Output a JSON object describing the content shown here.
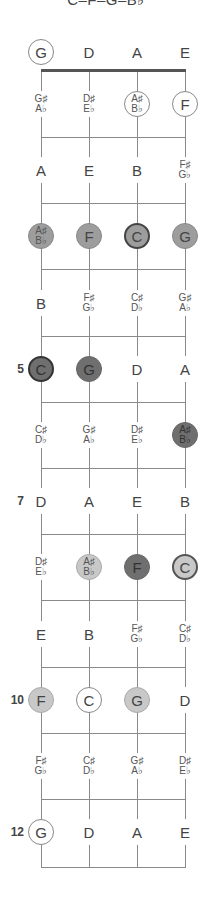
{
  "title": "C–F–G–B♭",
  "strings": [
    "G",
    "D",
    "A",
    "E"
  ],
  "fret_markers": [
    {
      "fret": 5,
      "label": "5"
    },
    {
      "fret": 7,
      "label": "7"
    },
    {
      "fret": 10,
      "label": "10"
    },
    {
      "fret": 12,
      "label": "12"
    }
  ],
  "legend_styles": {
    "plain": "not in chord",
    "outline": "chord tone (open/outlined)",
    "light": "light gray fill",
    "mid": "medium gray fill",
    "dark": "dark gray fill",
    "ring": "root emphasis"
  },
  "rows": [
    {
      "fret": 0,
      "notes": [
        {
          "label": "G",
          "style": "outline"
        },
        {
          "label": "D",
          "style": "plain"
        },
        {
          "label": "A",
          "style": "plain"
        },
        {
          "label": "E",
          "style": "plain"
        }
      ]
    },
    {
      "fret": 1,
      "notes": [
        {
          "label": "G♯|A♭",
          "style": "plain"
        },
        {
          "label": "D♯|E♭",
          "style": "plain"
        },
        {
          "label": "A♯|B♭",
          "style": "outline"
        },
        {
          "label": "F",
          "style": "outline"
        }
      ]
    },
    {
      "fret": 2,
      "notes": [
        {
          "label": "A",
          "style": "plain"
        },
        {
          "label": "E",
          "style": "plain"
        },
        {
          "label": "B",
          "style": "plain"
        },
        {
          "label": "F♯|G♭",
          "style": "plain"
        }
      ]
    },
    {
      "fret": 3,
      "notes": [
        {
          "label": "A♯|B♭",
          "style": "mid"
        },
        {
          "label": "F",
          "style": "mid"
        },
        {
          "label": "C",
          "style": "mid-ring"
        },
        {
          "label": "G",
          "style": "mid"
        }
      ]
    },
    {
      "fret": 4,
      "notes": [
        {
          "label": "B",
          "style": "plain"
        },
        {
          "label": "F♯|G♭",
          "style": "plain"
        },
        {
          "label": "C♯|D♭",
          "style": "plain"
        },
        {
          "label": "G♯|A♭",
          "style": "plain"
        }
      ]
    },
    {
      "fret": 5,
      "notes": [
        {
          "label": "C",
          "style": "dark-ring"
        },
        {
          "label": "G",
          "style": "dark"
        },
        {
          "label": "D",
          "style": "plain"
        },
        {
          "label": "A",
          "style": "plain"
        }
      ]
    },
    {
      "fret": 6,
      "notes": [
        {
          "label": "C♯|D♭",
          "style": "plain"
        },
        {
          "label": "G♯|A♭",
          "style": "plain"
        },
        {
          "label": "D♯|E♭",
          "style": "plain"
        },
        {
          "label": "A♯|B♭",
          "style": "dark"
        }
      ]
    },
    {
      "fret": 7,
      "notes": [
        {
          "label": "D",
          "style": "plain"
        },
        {
          "label": "A",
          "style": "plain"
        },
        {
          "label": "E",
          "style": "plain"
        },
        {
          "label": "B",
          "style": "plain"
        }
      ]
    },
    {
      "fret": 8,
      "notes": [
        {
          "label": "D♯|E♭",
          "style": "plain"
        },
        {
          "label": "A♯|B♭",
          "style": "light"
        },
        {
          "label": "F",
          "style": "dark"
        },
        {
          "label": "C",
          "style": "light-ring"
        }
      ]
    },
    {
      "fret": 9,
      "notes": [
        {
          "label": "E",
          "style": "plain"
        },
        {
          "label": "B",
          "style": "plain"
        },
        {
          "label": "F♯|G♭",
          "style": "plain"
        },
        {
          "label": "C♯|D♭",
          "style": "plain"
        }
      ]
    },
    {
      "fret": 10,
      "notes": [
        {
          "label": "F",
          "style": "light"
        },
        {
          "label": "C",
          "style": "outline"
        },
        {
          "label": "G",
          "style": "light"
        },
        {
          "label": "D",
          "style": "plain"
        }
      ]
    },
    {
      "fret": 11,
      "notes": [
        {
          "label": "F♯|G♭",
          "style": "plain"
        },
        {
          "label": "C♯|D♭",
          "style": "plain"
        },
        {
          "label": "G♯|A♭",
          "style": "plain"
        },
        {
          "label": "D♯|E♭",
          "style": "plain"
        }
      ]
    },
    {
      "fret": 12,
      "notes": [
        {
          "label": "G",
          "style": "outline"
        },
        {
          "label": "D",
          "style": "plain"
        },
        {
          "label": "A",
          "style": "plain"
        },
        {
          "label": "E",
          "style": "plain"
        }
      ]
    }
  ]
}
